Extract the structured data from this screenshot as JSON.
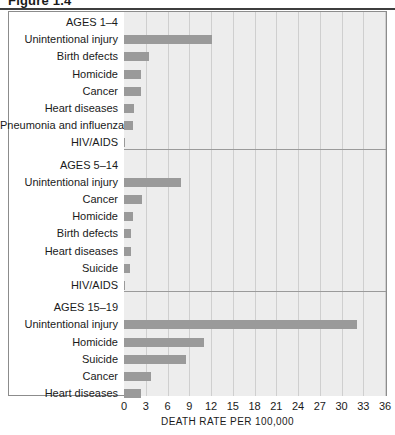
{
  "figure": {
    "title_partial": "Figure 1.4"
  },
  "chart_data": {
    "type": "bar",
    "orientation": "horizontal",
    "title": "",
    "xlabel": "DEATH RATE PER 100,000",
    "ylabel": "",
    "xlim": [
      0,
      36
    ],
    "xticks": [
      0,
      3,
      6,
      9,
      12,
      15,
      18,
      21,
      24,
      27,
      30,
      33,
      36
    ],
    "grid": true,
    "legend": "none",
    "bar_color": "#9a9a9a",
    "plot_background": "#ededed",
    "groups": [
      {
        "label": "AGES 1–4",
        "categories": [
          "Unintentional injury",
          "Birth defects",
          "Homicide",
          "Cancer",
          "Heart diseases",
          "Pneumonia and influenza",
          "HIV/AIDS"
        ],
        "values": [
          12.1,
          3.5,
          2.4,
          2.4,
          1.4,
          1.2,
          0.1
        ]
      },
      {
        "label": "AGES 5–14",
        "categories": [
          "Unintentional injury",
          "Cancer",
          "Homicide",
          "Birth defects",
          "Heart diseases",
          "Suicide",
          "HIV/AIDS"
        ],
        "values": [
          7.8,
          2.5,
          1.2,
          1.0,
          0.9,
          0.8,
          0.1
        ]
      },
      {
        "label": "AGES 15–19",
        "categories": [
          "Unintentional injury",
          "Homicide",
          "Suicide",
          "Cancer",
          "Heart diseases"
        ],
        "values": [
          32.1,
          11.1,
          8.6,
          3.7,
          2.4
        ]
      }
    ]
  }
}
